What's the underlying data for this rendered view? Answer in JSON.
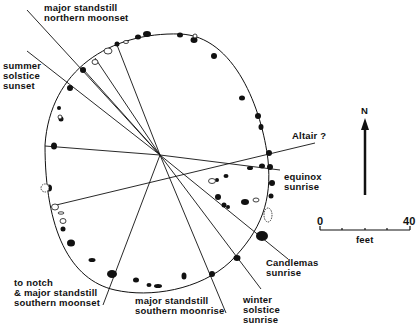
{
  "diagram": {
    "colors": {
      "ink": "#111111",
      "background": "#ffffff"
    },
    "labels": {
      "major_northern_moonset": "major standstill\nnorthern moonset",
      "summer_solstice_sunset": "summer\nsolstice\nsunset",
      "altair": "Altair ?",
      "equinox_sunrise": "equinox\nsunrise",
      "candlemas_sunrise": "Candlemas\nsunrise",
      "winter_solstice_sunrise": "winter\nsolstice\nsunrise",
      "major_southern_moonrise": "major standstill\nsouthern moonrise",
      "notch_southern_moonset": "to notch\n& major standstill\nsouthern moonset"
    },
    "north_arrow": {
      "label": "N"
    },
    "scale_bar": {
      "start": "0",
      "end": "40",
      "unit": "feet"
    }
  }
}
